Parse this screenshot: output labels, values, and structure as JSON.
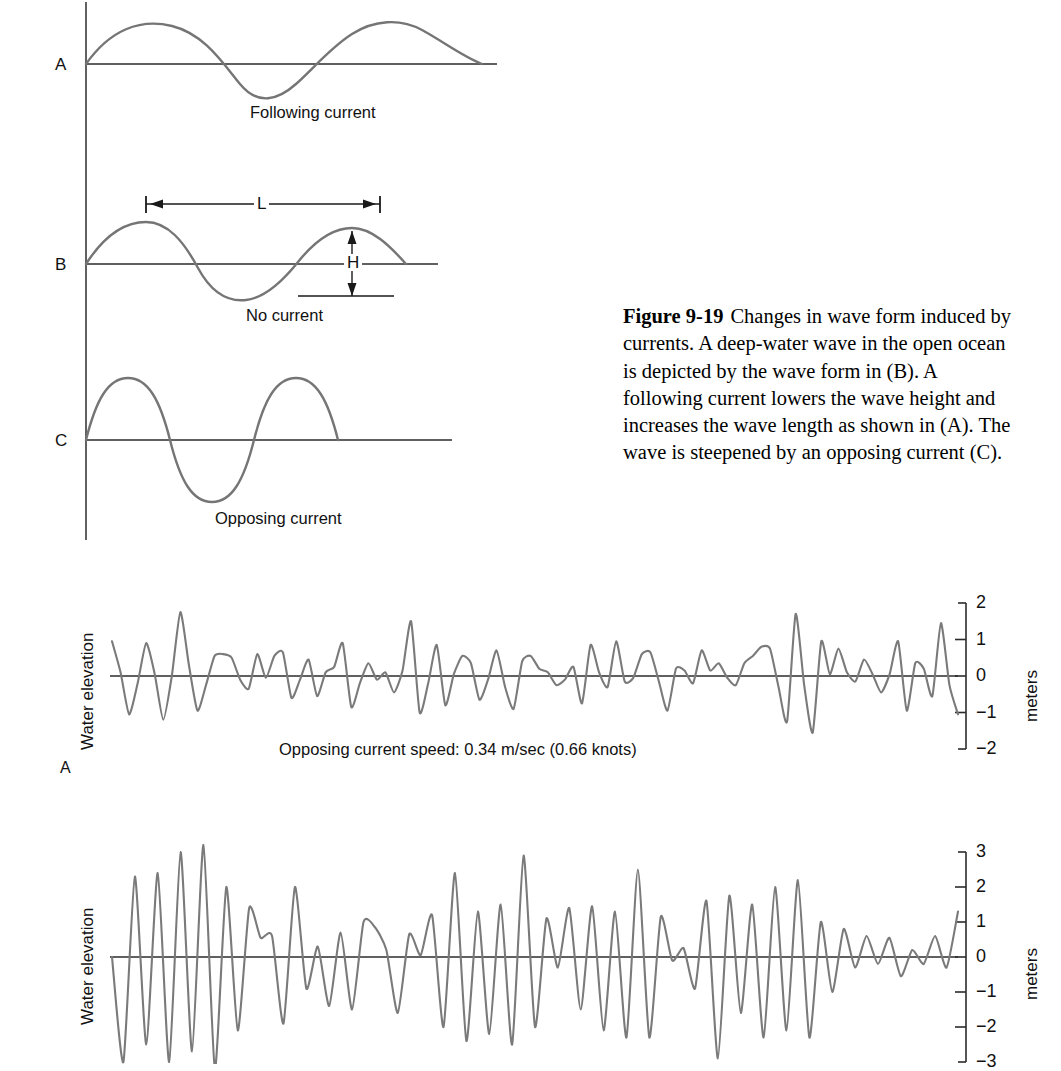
{
  "figure": {
    "number": "Figure 9-19",
    "caption": "Changes in wave form induced by currents. A deep-water wave in the open ocean is depicted by the wave form in (B). A following current lowers the wave height and increases the wave length as shown in (A). The wave is steepened by an opposing current (C)."
  },
  "schematic": {
    "panels": [
      {
        "letter": "A",
        "caption": "Following current"
      },
      {
        "letter": "B",
        "caption": "No current"
      },
      {
        "letter": "C",
        "caption": "Opposing current"
      }
    ],
    "dimensions": {
      "wavelength_label": "L",
      "height_label": "H"
    },
    "axis_color": "#3a3a3a",
    "wave_color": "#6e6e6e"
  },
  "charts": {
    "y_axis_unit": "meters",
    "y_axis_label_left": "Water elevation",
    "panel_a": {
      "letter": "A",
      "annotation": "Opposing current speed:  0.34 m/sec (0.66 knots)",
      "ticks": [
        "2",
        "1",
        "0",
        "−1",
        "−2"
      ],
      "tick_values": [
        2,
        1,
        0,
        -1,
        -2
      ],
      "unit": "meters",
      "vertical_label": "Water elevation"
    },
    "panel_b": {
      "letter": "",
      "annotation": "",
      "ticks": [
        "3",
        "2",
        "1",
        "0",
        "−1",
        "−2",
        "−3"
      ],
      "tick_values": [
        3,
        2,
        1,
        0,
        -1,
        -2,
        -3
      ],
      "unit": "meters",
      "vertical_label": "Water elevation"
    }
  },
  "chart_data": [
    {
      "type": "line",
      "id": "panel_a",
      "title": "Opposing current speed:  0.34 m/sec (0.66 knots)",
      "xlabel": "",
      "ylabel": "Water elevation",
      "yunit": "meters",
      "ylim": [
        -2,
        2
      ],
      "yticks": [
        2,
        1,
        0,
        -1,
        -2
      ],
      "grid": false,
      "legend": null,
      "note": "Irregular deep-water wave record; water surface elevation time series.",
      "values": [
        0.95,
        0.1,
        -1.05,
        -0.2,
        0.9,
        0.05,
        -1.2,
        0.0,
        1.75,
        0.3,
        -0.95,
        -0.25,
        0.55,
        0.6,
        0.5,
        -0.1,
        -0.35,
        0.6,
        -0.05,
        0.55,
        0.65,
        -0.6,
        -0.1,
        0.45,
        -0.55,
        0.1,
        0.25,
        0.9,
        -0.85,
        -0.2,
        0.35,
        -0.1,
        0.1,
        -0.45,
        0.15,
        1.5,
        -1.0,
        -0.2,
        0.85,
        -0.8,
        0.05,
        0.55,
        0.35,
        -0.65,
        -0.1,
        0.7,
        -0.3,
        -0.9,
        0.4,
        0.55,
        0.2,
        0.1,
        -0.25,
        -0.1,
        0.25,
        -0.75,
        0.85,
        0.1,
        -0.3,
        0.95,
        -0.15,
        -0.05,
        0.6,
        0.65,
        -0.15,
        -0.95,
        0.2,
        0.15,
        -0.2,
        0.7,
        0.15,
        0.35,
        -0.05,
        -0.25,
        0.35,
        0.55,
        0.8,
        0.75,
        -0.3,
        -1.25,
        1.7,
        -0.25,
        -1.55,
        0.95,
        0.05,
        0.75,
        0.1,
        -0.15,
        0.45,
        0.05,
        -0.45,
        0.05,
        0.95,
        -0.95,
        0.35,
        0.2,
        -0.55,
        1.45,
        -0.25,
        -1.05
      ]
    },
    {
      "type": "line",
      "id": "panel_b",
      "title": "",
      "xlabel": "",
      "ylabel": "Water elevation",
      "yunit": "meters",
      "ylim": [
        -3,
        3
      ],
      "yticks": [
        3,
        2,
        1,
        0,
        -1,
        -2,
        -3
      ],
      "grid": false,
      "legend": null,
      "note": "Steepened wave record with larger wave heights and sharper crests.",
      "values": [
        0.0,
        -3.0,
        2.3,
        -2.5,
        2.4,
        -3.0,
        3.0,
        -2.7,
        3.2,
        -3.2,
        2.0,
        -2.1,
        1.4,
        0.55,
        0.6,
        -1.9,
        2.0,
        -0.9,
        0.3,
        -1.4,
        0.7,
        -1.5,
        1.0,
        0.85,
        0.2,
        -1.6,
        0.65,
        0.05,
        1.2,
        -2.0,
        2.4,
        -2.4,
        1.3,
        -2.2,
        1.5,
        -2.5,
        2.9,
        -2.0,
        1.1,
        -0.3,
        1.4,
        -1.5,
        1.45,
        -2.1,
        1.3,
        -2.3,
        2.5,
        -2.3,
        1.15,
        -0.1,
        0.25,
        -0.9,
        1.6,
        -2.9,
        1.75,
        -1.6,
        1.5,
        -2.3,
        2.0,
        -2.1,
        2.2,
        -2.3,
        1.0,
        -1.0,
        0.8,
        -0.3,
        0.6,
        -0.2,
        0.55,
        -0.55,
        0.2,
        -0.2,
        0.6,
        -0.3,
        1.3
      ]
    }
  ]
}
